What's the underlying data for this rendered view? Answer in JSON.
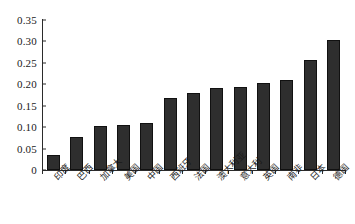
{
  "chart_data": {
    "type": "bar",
    "title": "",
    "xlabel": "",
    "ylabel": "",
    "ylim": [
      0,
      0.35
    ],
    "ytick_labels": [
      "0.35",
      "0.30",
      "0.25",
      "0.20",
      "0.15",
      "0.10",
      "0.05",
      "0"
    ],
    "ytick_values": [
      0.35,
      0.3,
      0.25,
      0.2,
      0.15,
      0.1,
      0.05,
      0
    ],
    "grid": false,
    "legend": false,
    "bar_color": "#2e2e2e",
    "axis_color": "#2b2b2b",
    "background": "#ffffff",
    "categories": [
      "印度",
      "巴西",
      "加拿大",
      "美国",
      "中国",
      "西班牙",
      "法国",
      "澳大利亚",
      "意大利",
      "英国",
      "南非",
      "日本",
      "德国"
    ],
    "values": [
      0.034,
      0.076,
      0.103,
      0.106,
      0.109,
      0.167,
      0.179,
      0.191,
      0.193,
      0.202,
      0.211,
      0.256,
      0.303
    ]
  }
}
